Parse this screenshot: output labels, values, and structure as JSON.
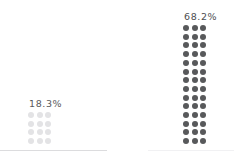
{
  "chart_data": {
    "type": "bar",
    "title": "",
    "subtitle": "",
    "xlabel": "",
    "ylabel": "",
    "legend": [],
    "grid": false,
    "unit": "%",
    "dots_per_unit_note": "each dot represents approximately 1.6%",
    "categories": [
      "18.3%",
      "68.2%"
    ],
    "values": [
      18.3,
      68.2
    ],
    "series": [
      {
        "name": "proportion",
        "values": [
          18.3,
          68.2
        ],
        "labels": [
          "18.3%",
          "68.2%"
        ],
        "dot_counts": [
          12,
          42
        ],
        "dot_columns": [
          3,
          3
        ],
        "dot_rows": [
          4,
          14
        ],
        "colors": [
          "#e3e3e5",
          "#58595b"
        ]
      }
    ]
  },
  "groups": [
    {
      "id": "group-a",
      "label": "18.3%",
      "value": 18.3,
      "dot_count": 12,
      "columns": 3,
      "rows": 4,
      "dot_color": "#e3e3e5",
      "label_color": "#58595b"
    },
    {
      "id": "group-b",
      "label": "68.2%",
      "value": 68.2,
      "dot_count": 42,
      "columns": 3,
      "rows": 14,
      "dot_color": "#58595b",
      "label_color": "#4d4e50"
    }
  ],
  "baselines": [
    {
      "id": "baseline-a",
      "color": "#dcdcde"
    },
    {
      "id": "baseline-b",
      "color": "#f1f1f3"
    }
  ],
  "canvas": {
    "background": "#ffffff",
    "width": 249,
    "height": 156
  }
}
